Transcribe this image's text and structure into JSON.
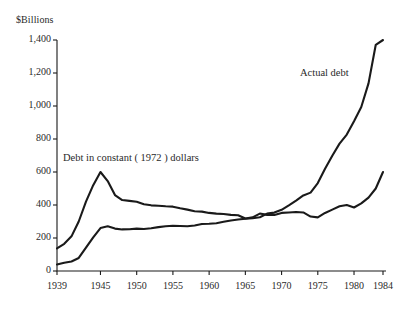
{
  "chart_data": {
    "type": "line",
    "title": "",
    "subtitle": "",
    "xlabel": "",
    "ylabel": "$Billions",
    "ylim": [
      0,
      1400
    ],
    "xlim": [
      1939,
      1984
    ],
    "grid": false,
    "legend_position": "inline-annotations",
    "y_ticks": [
      "0",
      "200",
      "400",
      "600",
      "800",
      "1,000",
      "1,200",
      "1,400"
    ],
    "y_tick_values": [
      0,
      200,
      400,
      600,
      800,
      1000,
      1200,
      1400
    ],
    "x_ticks": [
      "1939",
      "1945",
      "1950",
      "1955",
      "1960",
      "1965",
      "1970",
      "1975",
      "1980",
      "1984"
    ],
    "x_tick_values": [
      1939,
      1945,
      1950,
      1955,
      1960,
      1965,
      1970,
      1975,
      1980,
      1984
    ],
    "series": [
      {
        "name": "Actual debt",
        "annotation": "Actual debt",
        "color": "#1a1a1a",
        "x": [
          1939,
          1940,
          1941,
          1942,
          1943,
          1944,
          1945,
          1946,
          1947,
          1948,
          1949,
          1950,
          1951,
          1952,
          1953,
          1954,
          1955,
          1956,
          1957,
          1958,
          1959,
          1960,
          1961,
          1962,
          1963,
          1964,
          1965,
          1966,
          1967,
          1968,
          1969,
          1970,
          1971,
          1972,
          1973,
          1974,
          1975,
          1976,
          1977,
          1978,
          1979,
          1980,
          1981,
          1982,
          1983,
          1984
        ],
        "values": [
          40,
          50,
          58,
          79,
          142,
          204,
          260,
          271,
          257,
          252,
          253,
          257,
          255,
          259,
          266,
          271,
          274,
          273,
          271,
          276,
          285,
          286,
          289,
          298,
          306,
          312,
          317,
          320,
          326,
          348,
          354,
          371,
          398,
          427,
          458,
          475,
          533,
          620,
          699,
          772,
          827,
          908,
          994,
          1137,
          1371,
          1400
        ],
        "end_value": 1400
      },
      {
        "name": "Debt in constant ( 1972 ) dollars",
        "annotation": "Debt in constant ( 1972 ) dollars",
        "color": "#1a1a1a",
        "x": [
          1939,
          1940,
          1941,
          1942,
          1943,
          1944,
          1945,
          1946,
          1947,
          1948,
          1949,
          1950,
          1951,
          1952,
          1953,
          1954,
          1955,
          1956,
          1957,
          1958,
          1959,
          1960,
          1961,
          1962,
          1963,
          1964,
          1965,
          1966,
          1967,
          1968,
          1969,
          1970,
          1971,
          1972,
          1973,
          1974,
          1975,
          1976,
          1977,
          1978,
          1979,
          1980,
          1981,
          1982,
          1983,
          1984
        ],
        "values": [
          137,
          165,
          210,
          300,
          420,
          520,
          600,
          545,
          460,
          430,
          425,
          420,
          405,
          398,
          395,
          392,
          390,
          380,
          372,
          362,
          360,
          352,
          348,
          345,
          340,
          338,
          318,
          325,
          348,
          340,
          340,
          352,
          355,
          358,
          355,
          330,
          325,
          352,
          372,
          392,
          400,
          385,
          410,
          445,
          500,
          600
        ],
        "end_value": 600
      }
    ]
  },
  "annotations": {
    "actual_debt": "Actual debt",
    "constant_dollars": "Debt in constant ( 1972 ) dollars"
  },
  "axis": {
    "unit_label": "$Billions"
  }
}
